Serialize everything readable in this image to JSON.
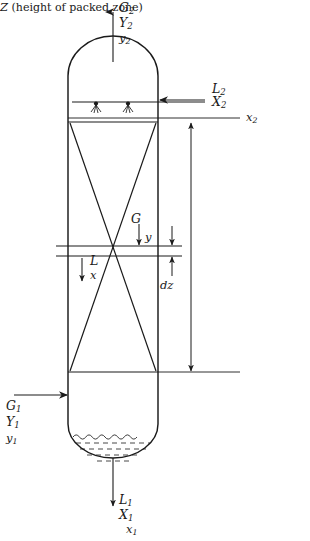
{
  "diagram": {
    "type": "process-equipment-schematic",
    "colors": {
      "line": "#1a1a1a",
      "background": "#ffffff",
      "liquid": "#1a1a1a"
    }
  },
  "streams": {
    "gas_out": {
      "position": "top",
      "direction": "up",
      "flow_label": "G",
      "flow_sub": "2",
      "ratio_label": "Y",
      "ratio_sub": "2",
      "fraction_label": "y",
      "fraction_sub": "2"
    },
    "liquid_in": {
      "position": "top-right",
      "direction": "left",
      "flow_label": "L",
      "flow_sub": "2",
      "ratio_label": "X",
      "ratio_sub": "2",
      "fraction_label": "x",
      "fraction_sub": "2"
    },
    "gas_in": {
      "position": "bottom-left",
      "direction": "right",
      "flow_label": "G",
      "flow_sub": "1",
      "ratio_label": "Y",
      "ratio_sub": "1",
      "fraction_label": "y",
      "fraction_sub": "1"
    },
    "liquid_out": {
      "position": "bottom",
      "direction": "down",
      "flow_label": "L",
      "flow_sub": "1",
      "ratio_label": "X",
      "ratio_sub": "1",
      "fraction_label": "x",
      "fraction_sub": "1"
    }
  },
  "element": {
    "gas_flow_label": "G",
    "gas_fraction_label": "y",
    "liquid_flow_label": "L",
    "liquid_fraction_label": "x",
    "thickness_label": "dz"
  },
  "dimension": {
    "symbol": "Z",
    "description": "(height of packed zone)"
  },
  "internals": {
    "distributor": "liquid-distributor-with-two-spray-nozzles",
    "packing": "crossed-diagonal-packing-hatching",
    "support": "packing-support-grid",
    "sump": "liquid-pool-in-dished-bottom"
  }
}
